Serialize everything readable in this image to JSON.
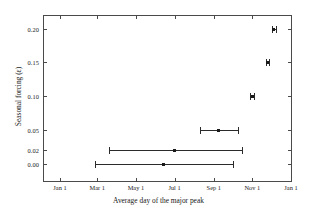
{
  "chart_data": {
    "type": "scatter",
    "title": "",
    "xlabel": "Average day of the major peak",
    "ylabel": "Seasonal forcing (ε)",
    "grid": false,
    "legend": null,
    "x_tick_labels": [
      "Jan 1",
      "Mar 1",
      "May 1",
      "Jul 1",
      "Sep 1",
      "Nov 1",
      "Jan 1"
    ],
    "x_tick_days": [
      0,
      59,
      120,
      181,
      243,
      304,
      365
    ],
    "y_tick_labels": [
      "0.00",
      "0.02",
      "0.05",
      "0.10",
      "0.15",
      "0.20"
    ],
    "y_tick_values": [
      0.0,
      0.02,
      0.05,
      0.1,
      0.15,
      0.2
    ],
    "y_axis_scale": "categorical",
    "xlim_days": [
      -28,
      392
    ],
    "points": [
      {
        "y_label": "0.00",
        "y": 0.0,
        "x_label": "Jun 13",
        "x_day": 164,
        "x_low_label": "Feb 26",
        "x_low_day": 56,
        "x_high_label": "Oct 1",
        "x_high_day": 273
      },
      {
        "y_label": "0.02",
        "y": 0.02,
        "x_label": "Jul 1",
        "x_day": 181,
        "x_low_label": "Mar 20",
        "x_low_day": 78,
        "x_high_label": "Oct 16",
        "x_high_day": 288
      },
      {
        "y_label": "0.05",
        "y": 0.05,
        "x_label": "Sep 8",
        "x_day": 250,
        "x_low_label": "Aug 10",
        "x_low_day": 221,
        "x_high_label": "Oct 9",
        "x_high_day": 281
      },
      {
        "y_label": "0.10",
        "y": 0.1,
        "x_label": "Nov 1",
        "x_day": 304,
        "x_low_label": "Oct 29",
        "x_low_day": 301,
        "x_high_label": "Nov 4",
        "x_high_day": 307
      },
      {
        "y_label": "0.15",
        "y": 0.15,
        "x_label": "Nov 25",
        "x_day": 328,
        "x_low_label": "Nov 22",
        "x_low_day": 325,
        "x_high_label": "Nov 28",
        "x_high_day": 331
      },
      {
        "y_label": "0.20",
        "y": 0.2,
        "x_label": "Dec 5",
        "x_day": 338,
        "x_low_label": "Dec 2",
        "x_low_day": 335,
        "x_high_label": "Dec 8",
        "x_high_day": 341
      }
    ]
  }
}
